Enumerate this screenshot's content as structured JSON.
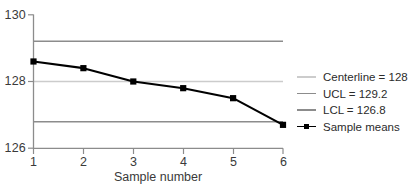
{
  "chart_data": {
    "type": "line",
    "title": "",
    "xlabel": "Sample number",
    "ylabel": "",
    "x": [
      1,
      2,
      3,
      4,
      5,
      6
    ],
    "categories": [
      "1",
      "2",
      "3",
      "4",
      "5",
      "6"
    ],
    "series": [
      {
        "name": "Sample means",
        "values": [
          128.6,
          128.4,
          128.0,
          127.8,
          127.5,
          126.7
        ],
        "color": "#000000",
        "marker": "square"
      }
    ],
    "reference_lines": [
      {
        "name": "Centerline",
        "value": 128,
        "label": "Centerline = 128",
        "color": "#c9c9c9"
      },
      {
        "name": "UCL",
        "value": 129.2,
        "label": "UCL = 129.2",
        "color": "#8c8c8c"
      },
      {
        "name": "LCL",
        "value": 126.8,
        "label": "LCL = 126.8",
        "color": "#8c8c8c"
      }
    ],
    "xlim": [
      1,
      6
    ],
    "ylim": [
      126,
      130
    ],
    "yticks": [
      126,
      128,
      130
    ],
    "ytick_labels": [
      "126",
      "128",
      "130"
    ],
    "xticks": [
      1,
      2,
      3,
      4,
      5,
      6
    ],
    "xtick_labels": [
      "1",
      "2",
      "3",
      "4",
      "5",
      "6"
    ],
    "grid": false,
    "legend_position": "right"
  },
  "axes": {
    "y_labels": [
      "130",
      "128",
      "126"
    ],
    "x_labels": [
      "1",
      "2",
      "3",
      "4",
      "5",
      "6"
    ],
    "x_title": "Sample number"
  },
  "legend": {
    "items": [
      {
        "label": "Centerline = 128",
        "style": "line",
        "color": "#c9c9c9"
      },
      {
        "label": "UCL = 129.2",
        "style": "line",
        "color": "#8c8c8c"
      },
      {
        "label": "LCL = 126.8",
        "style": "line",
        "color": "#8c8c8c"
      },
      {
        "label": "Sample means",
        "style": "line-marker",
        "color": "#000000"
      }
    ]
  },
  "colors": {
    "axis": "#8c8c8c",
    "centerline": "#c9c9c9",
    "control_limit": "#8c8c8c",
    "series": "#000000",
    "text": "#3a3a3a",
    "background": "#ffffff"
  }
}
